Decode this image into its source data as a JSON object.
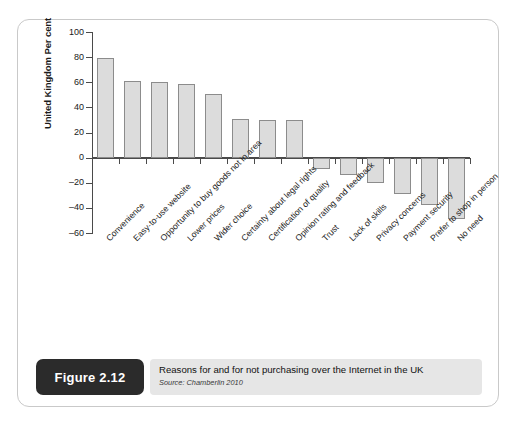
{
  "figure": {
    "badge_label": "Figure 2.12",
    "caption": "Reasons for and for not purchasing over the Internet in the UK",
    "source": "Source: Chamberlin 2010"
  },
  "chart_data": {
    "type": "bar",
    "title": "",
    "xlabel": "",
    "ylabel": "United Kingdom Per cent",
    "ylim": [
      -60,
      100
    ],
    "yticks": [
      100,
      80,
      60,
      40,
      20,
      0,
      -20,
      -40,
      -60
    ],
    "ytick_labels": [
      "100",
      "80",
      "60",
      "40",
      "20",
      "0",
      "–20",
      "–40",
      "–60"
    ],
    "grid": false,
    "legend": "none",
    "bar_fill": "#dcdcdc",
    "bar_stroke": "#8c8c8c",
    "categories": [
      "Convenience",
      "Easy-to-use website",
      "Opportunity to buy goods not in area",
      "Lower prices",
      "Wider choice",
      "Certainty about legal rights",
      "Certification of quality",
      "Opinion rating and feedback",
      "Trust",
      "Lack of skills",
      "Privacy concerns",
      "Payment security",
      "Prefer to shop in person",
      "No need"
    ],
    "values": [
      79,
      61,
      60,
      59,
      51,
      31,
      30,
      30,
      -9,
      -14,
      -20,
      -29,
      -38,
      -49
    ]
  }
}
